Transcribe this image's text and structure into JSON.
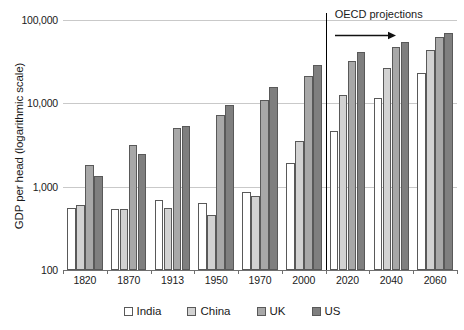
{
  "chart_data": {
    "type": "bar",
    "title": "",
    "subtitle": "",
    "xlabel": "",
    "ylabel": "GDP per head (logarithmic scale)",
    "scale": "log",
    "ylim": [
      100,
      100000
    ],
    "ytick_labels": [
      "100,000",
      "10,000",
      "1,000",
      "100"
    ],
    "ytick_values": [
      100000,
      10000,
      1000,
      100
    ],
    "grid": true,
    "legend_position": "bottom",
    "categories": [
      "1820",
      "1870",
      "1913",
      "1950",
      "1970",
      "2000",
      "2020",
      "2040",
      "2060"
    ],
    "series": [
      {
        "name": "India",
        "color": "#ffffff",
        "values": [
          560,
          540,
          690,
          640,
          860,
          1950,
          4600,
          11500,
          23000
        ]
      },
      {
        "name": "China",
        "color": "#d2d2d2",
        "values": [
          600,
          540,
          560,
          460,
          780,
          3500,
          12500,
          26500,
          44000
        ]
      },
      {
        "name": "UK",
        "color": "#a8a8a8",
        "values": [
          1800,
          3200,
          5000,
          7300,
          11000,
          21000,
          32000,
          47000,
          62000
        ]
      },
      {
        "name": "US",
        "color": "#7f7f7f",
        "values": [
          1350,
          2450,
          5300,
          9600,
          15500,
          29000,
          41000,
          55000,
          70000
        ]
      }
    ],
    "annotations": [
      {
        "name": "oecd-projections",
        "text": "OECD projections",
        "arrow": "right",
        "divider_after_category": "2000"
      }
    ]
  },
  "legend": {
    "items": [
      {
        "label": "India"
      },
      {
        "label": "China"
      },
      {
        "label": "UK"
      },
      {
        "label": "US"
      }
    ]
  }
}
